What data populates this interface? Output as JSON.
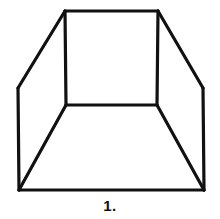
{
  "figure": {
    "caption": "1.",
    "background_color": "#ffffff",
    "stroke_color": "#111111",
    "stroke_width": 3.2,
    "canvas": {
      "width": 220,
      "height": 219
    },
    "geometry": {
      "back_wall": {
        "name": "back-wall-rectangle",
        "top_left": [
          65,
          11
        ],
        "top_right": [
          158,
          11
        ],
        "bottom_right": [
          157,
          105
        ],
        "bottom_left": [
          66,
          105
        ],
        "points": "65,11 158,11 157,105 66,105 65,11"
      },
      "left_wall": {
        "name": "left-wall-quad",
        "points": "65,11 18,88 19,190 66,105"
      },
      "right_wall": {
        "name": "right-wall-quad",
        "points": "158,11 203,88 204,190 157,105"
      },
      "floor": {
        "name": "floor-quad",
        "points": "66,105 19,190 204,190 157,105"
      },
      "edges": [
        {
          "name": "back-wall-top-edge",
          "from": [
            65,
            11
          ],
          "to": [
            158,
            11
          ]
        },
        {
          "name": "back-wall-right-edge",
          "from": [
            158,
            11
          ],
          "to": [
            157,
            105
          ]
        },
        {
          "name": "back-wall-bottom-edge",
          "from": [
            157,
            105
          ],
          "to": [
            66,
            105
          ]
        },
        {
          "name": "back-wall-left-edge",
          "from": [
            66,
            105
          ],
          "to": [
            65,
            11
          ]
        },
        {
          "name": "top-left-diagonal-edge",
          "from": [
            65,
            11
          ],
          "to": [
            18,
            88
          ]
        },
        {
          "name": "top-right-diagonal-edge",
          "from": [
            158,
            11
          ],
          "to": [
            203,
            88
          ]
        },
        {
          "name": "left-outer-vertical-edge",
          "from": [
            18,
            88
          ],
          "to": [
            19,
            190
          ]
        },
        {
          "name": "right-outer-vertical-edge",
          "from": [
            203,
            88
          ],
          "to": [
            204,
            190
          ]
        },
        {
          "name": "bottom-outer-edge",
          "from": [
            19,
            190
          ],
          "to": [
            204,
            190
          ]
        },
        {
          "name": "floor-left-diagonal-edge",
          "from": [
            66,
            105
          ],
          "to": [
            19,
            190
          ]
        },
        {
          "name": "floor-right-diagonal-edge",
          "from": [
            157,
            105
          ],
          "to": [
            204,
            190
          ]
        }
      ]
    }
  }
}
